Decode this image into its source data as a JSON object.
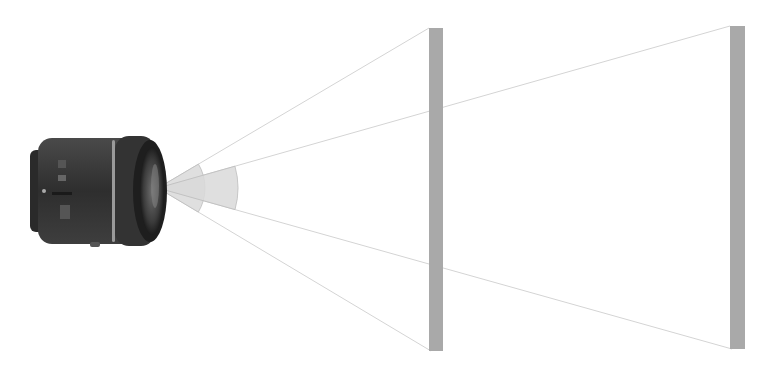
{
  "diagram": {
    "colors": {
      "background": "#ffffff",
      "screen": "#a9a9a9",
      "ray": "#d4d4d4",
      "wedge_fill": "#d9d9d9",
      "wedge_stroke": "#bdbdbd",
      "lens_body": "#3a3a3a",
      "lens_dark": "#222222",
      "lens_highlight": "#8a8a8a"
    },
    "lens": {
      "x": 30,
      "y": 135,
      "width": 140,
      "height": 112
    },
    "apex": {
      "x": 158,
      "y": 188
    },
    "screens": [
      {
        "id": "near-screen",
        "x": 429,
        "top": 28,
        "bottom": 351,
        "width": 14
      },
      {
        "id": "far-screen",
        "x": 730,
        "top": 26,
        "bottom": 349,
        "width": 15
      }
    ],
    "rays": [
      {
        "id": "wide-top",
        "to": {
          "x": 429,
          "y": 28
        }
      },
      {
        "id": "wide-bottom",
        "to": {
          "x": 431,
          "y": 351
        }
      },
      {
        "id": "narrow-top",
        "to": {
          "x": 730,
          "y": 26
        }
      },
      {
        "id": "narrow-bottom",
        "to": {
          "x": 732,
          "y": 349
        }
      }
    ],
    "wedges": [
      {
        "id": "wide-angle-wedge",
        "radius": 47
      },
      {
        "id": "narrow-angle-wedge",
        "radius": 80
      }
    ]
  }
}
